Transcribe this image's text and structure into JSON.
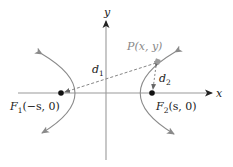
{
  "diagram": {
    "type": "hyperbola",
    "axes": {
      "x_label": "x",
      "y_label": "y"
    },
    "foci": [
      {
        "name": "F",
        "subscript": "1",
        "coords": "(−s, 0)"
      },
      {
        "name": "F",
        "subscript": "2",
        "coords": "(s, 0)"
      }
    ],
    "point": {
      "label": "P(x, y)"
    },
    "distances": [
      {
        "name": "d",
        "subscript": "1"
      },
      {
        "name": "d",
        "subscript": "2"
      }
    ],
    "colors": {
      "axis": "#9a9a9a",
      "curve": "#8a8a8a",
      "dashed": "#777777",
      "focus": "#111111",
      "point": "#9a9a9a",
      "text": "#222222"
    }
  }
}
